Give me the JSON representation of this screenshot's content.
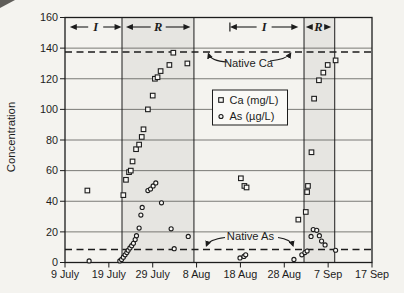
{
  "figure": {
    "y_axis_label": "Concentration",
    "colors": {
      "paper": "#f4f3ef",
      "shade": "#e6e5e1",
      "ink": "#1c1c1c",
      "grid": "#52524e",
      "marker_fill": "#faf9f6"
    }
  },
  "chart_data": {
    "type": "scatter",
    "title": "",
    "xlabel": "",
    "ylabel": "Concentration",
    "grid": "horizontal-only",
    "x_axis": {
      "domain_days": [
        0,
        70
      ],
      "day0_date": "9 July",
      "tick_days": [
        0,
        10,
        20,
        30,
        40,
        50,
        60,
        70
      ],
      "tick_labels": [
        "9 July",
        "19 July",
        "29 July",
        "8 Aug",
        "18 Aug",
        "28 Aug",
        "7 Sep",
        "17 Sep"
      ]
    },
    "y_axis": {
      "range": [
        0,
        160
      ],
      "ticks": [
        0,
        20,
        40,
        60,
        80,
        100,
        120,
        140,
        160
      ]
    },
    "legend": {
      "position": "center",
      "entries": [
        {
          "marker": "square",
          "label": "Ca (mg/L)"
        },
        {
          "marker": "circle",
          "label": "As (µg/L)"
        }
      ]
    },
    "shaded_regions": [
      {
        "from_day": 13.0,
        "to_day": 29.4
      },
      {
        "from_day": 54.5,
        "to_day": 61.5
      }
    ],
    "phase_arrows": [
      {
        "label": "I",
        "from_day": 1.1,
        "to_day": 12.9,
        "start_bar": false
      },
      {
        "label": "R",
        "from_day": 13.9,
        "to_day": 28.6,
        "start_bar": false
      },
      {
        "label": "I",
        "from_day": 37.6,
        "to_day": 53.2,
        "start_bar": true
      },
      {
        "label": "R",
        "from_day": 54.9,
        "to_day": 60.7,
        "start_bar": false
      }
    ],
    "native_lines": [
      {
        "label": "Native Ca",
        "value": 137.5
      },
      {
        "label": "Native As",
        "value": 8.5
      }
    ],
    "series": [
      {
        "name": "Ca (mg/L)",
        "marker": "square",
        "points": [
          [
            5.1,
            47
          ],
          [
            13.3,
            44
          ],
          [
            13.9,
            54
          ],
          [
            14.6,
            59
          ],
          [
            15.0,
            60
          ],
          [
            15.4,
            66
          ],
          [
            16.2,
            74
          ],
          [
            16.9,
            77
          ],
          [
            17.5,
            82
          ],
          [
            17.9,
            87
          ],
          [
            18.9,
            100
          ],
          [
            20.0,
            109
          ],
          [
            20.5,
            120
          ],
          [
            21.1,
            121
          ],
          [
            21.8,
            125
          ],
          [
            23.8,
            129
          ],
          [
            24.7,
            137
          ],
          [
            27.9,
            130
          ],
          [
            40.1,
            55
          ],
          [
            40.9,
            50
          ],
          [
            41.4,
            49
          ],
          [
            53.2,
            28
          ],
          [
            54.9,
            33
          ],
          [
            55.2,
            46
          ],
          [
            55.4,
            50
          ],
          [
            56.2,
            72
          ],
          [
            56.8,
            107
          ],
          [
            57.9,
            119
          ],
          [
            58.9,
            124
          ],
          [
            59.9,
            129
          ],
          [
            61.7,
            132
          ]
        ]
      },
      {
        "name": "As (µg/L)",
        "marker": "circle",
        "points": [
          [
            5.5,
            1
          ],
          [
            12.5,
            1
          ],
          [
            12.9,
            2
          ],
          [
            13.3,
            3.5
          ],
          [
            13.7,
            5
          ],
          [
            14.1,
            6.5
          ],
          [
            14.4,
            8
          ],
          [
            14.8,
            9.5
          ],
          [
            15.2,
            11
          ],
          [
            15.6,
            12.5
          ],
          [
            16.0,
            15
          ],
          [
            16.3,
            17.5
          ],
          [
            16.9,
            22.5
          ],
          [
            17.3,
            31
          ],
          [
            17.6,
            36
          ],
          [
            18.9,
            47
          ],
          [
            19.5,
            48
          ],
          [
            20.1,
            50
          ],
          [
            20.7,
            52
          ],
          [
            22.0,
            39
          ],
          [
            24.2,
            22
          ],
          [
            24.9,
            9
          ],
          [
            28.1,
            17
          ],
          [
            39.9,
            3
          ],
          [
            40.8,
            4
          ],
          [
            41.2,
            5
          ],
          [
            52.2,
            2
          ],
          [
            54.0,
            5
          ],
          [
            54.7,
            6.5
          ],
          [
            55.2,
            7.5
          ],
          [
            56.1,
            17
          ],
          [
            56.6,
            21.5
          ],
          [
            57.4,
            21
          ],
          [
            58.0,
            17.5
          ],
          [
            58.5,
            14
          ],
          [
            59.3,
            11.5
          ],
          [
            61.7,
            8
          ]
        ]
      }
    ]
  }
}
